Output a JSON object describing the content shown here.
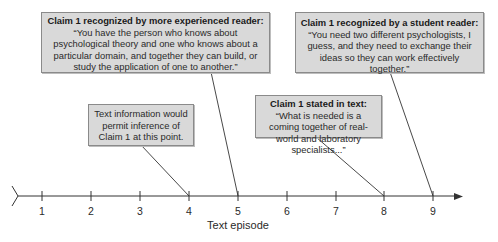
{
  "diagram": {
    "type": "timeline",
    "axis": {
      "label": "Text episode",
      "ticks": [
        "1",
        "2",
        "3",
        "4",
        "5",
        "6",
        "7",
        "8",
        "9"
      ]
    },
    "callouts": [
      {
        "id": "experienced-reader",
        "title": "Claim 1 recognized by more experienced reader:",
        "body": "“You have the person who knows about psychological theory and one who knows about a particular domain, and together they can build, or study the application of one to another.”",
        "points_to_episode": "5"
      },
      {
        "id": "student-reader",
        "title": "Claim 1 recognized by a student reader:",
        "body": "“You need two different psychologists, I guess, and they need to exchange their ideas so they can work effectively together.”",
        "points_to_episode": "9"
      },
      {
        "id": "inference-point",
        "title": "",
        "body": "Text information would permit inference of Claim 1 at this point.",
        "points_to_episode": "4"
      },
      {
        "id": "stated-in-text",
        "title": "Claim 1 stated in text:",
        "body": "“What is needed is a coming together of real-world and laboratory specialists...”",
        "points_to_episode": "8"
      }
    ]
  },
  "colors": {
    "box_fill": "#d9d9d9",
    "box_border": "#8a8a8a",
    "line": "#333333"
  }
}
